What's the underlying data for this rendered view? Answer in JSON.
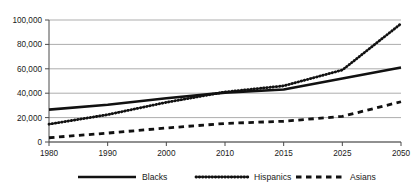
{
  "chart_data": {
    "type": "line",
    "title": "",
    "xlabel": "",
    "ylabel": "",
    "categories": [
      "1980",
      "1990",
      "2000",
      "2010",
      "2015",
      "2025",
      "2050"
    ],
    "ylim": [
      0,
      100000
    ],
    "ytick_values": [
      0,
      20000,
      40000,
      60000,
      80000,
      100000
    ],
    "ytick_labels": [
      "0",
      "20,000",
      "40,000",
      "60,000",
      "80,000",
      "100,000"
    ],
    "grid": true,
    "legend_position": "bottom",
    "series": [
      {
        "name": "Blacks",
        "style": "solid",
        "color": "#111111",
        "values": [
          26500,
          30500,
          35800,
          40500,
          43000,
          52000,
          61000
        ]
      },
      {
        "name": "Hispanics",
        "style": "dotted",
        "color": "#111111",
        "values": [
          14600,
          22400,
          32500,
          41000,
          46000,
          59000,
          97000
        ]
      },
      {
        "name": "Asians",
        "style": "dashed",
        "color": "#111111",
        "values": [
          3500,
          7300,
          11500,
          15200,
          17000,
          21000,
          33000
        ]
      }
    ]
  },
  "legend": {
    "items": [
      {
        "label": "Blacks",
        "style": "solid"
      },
      {
        "label": "Hispanics",
        "style": "dotted"
      },
      {
        "label": "Asians",
        "style": "dashed"
      }
    ]
  },
  "axis": {
    "y_labels": [
      "100,000",
      "80,000",
      "60,000",
      "40,000",
      "20,000",
      "0"
    ],
    "x_labels": [
      "1980",
      "1990",
      "2000",
      "2010",
      "2015",
      "2025",
      "2050"
    ]
  }
}
